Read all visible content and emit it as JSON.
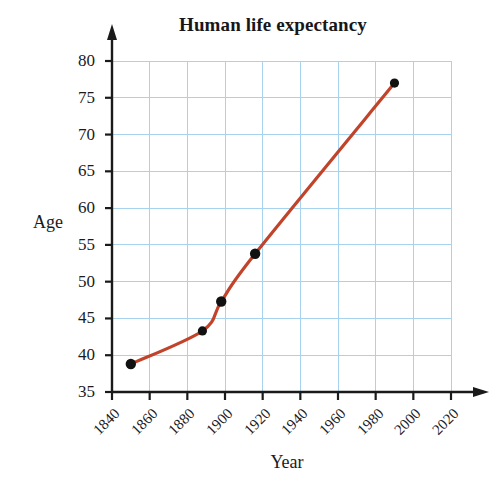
{
  "chart_data": {
    "type": "line",
    "title": "Human life expectancy",
    "xlabel": "Year",
    "ylabel": "Age",
    "grid": true,
    "legend": false,
    "xlim": [
      1840,
      2020
    ],
    "ylim": [
      35,
      80
    ],
    "xticks": [
      "1840",
      "1860",
      "1880",
      "1900",
      "1920",
      "1940",
      "1960",
      "1980",
      "2000",
      "2020"
    ],
    "yticks": [
      "35",
      "40",
      "45",
      "50",
      "55",
      "60",
      "65",
      "70",
      "75",
      "80"
    ],
    "xtick_values": [
      1840,
      1860,
      1880,
      1900,
      1920,
      1940,
      1960,
      1980,
      2000,
      2020
    ],
    "ytick_values": [
      35,
      40,
      45,
      50,
      55,
      60,
      65,
      70,
      75,
      80
    ],
    "x": [
      1850,
      1888,
      1898,
      1916,
      1990
    ],
    "values": [
      38.8,
      43.3,
      47.3,
      53.8,
      77.0
    ],
    "points": [
      {
        "x": 1850,
        "y": 38.8
      },
      {
        "x": 1888,
        "y": 43.3
      },
      {
        "x": 1898,
        "y": 47.3
      },
      {
        "x": 1916,
        "y": 53.8
      },
      {
        "x": 1990,
        "y": 77.0
      }
    ],
    "series_color": "#c1432a",
    "marker_color": "#111111",
    "grid_color": "#a8d3ef",
    "axis_color": "#1a1a1a"
  }
}
